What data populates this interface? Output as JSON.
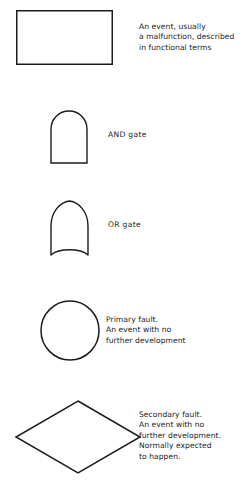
{
  "figure": {
    "background_color": "#ffffff",
    "line_color": "#1c1c1c",
    "text_color": "#1c1c1c"
  },
  "symbols": [
    {
      "id": "rectangle",
      "shape_name": "rectangle-symbol",
      "caption": "An event, usually\na malfunction, described\nin functional terms"
    },
    {
      "id": "and-gate",
      "shape_name": "and-gate-symbol",
      "caption": "AND gate"
    },
    {
      "id": "or-gate",
      "shape_name": "or-gate-symbol",
      "caption": "OR gate"
    },
    {
      "id": "circle",
      "shape_name": "circle-symbol",
      "caption": "Primary fault.\nAn event with no\nfurther development"
    },
    {
      "id": "diamond",
      "shape_name": "diamond-symbol",
      "caption": "Secondary fault.\nAn event with no\nfurther development.\nNormally expected\nto happen."
    }
  ],
  "artifact": {
    "bottom_edge_text": ""
  }
}
